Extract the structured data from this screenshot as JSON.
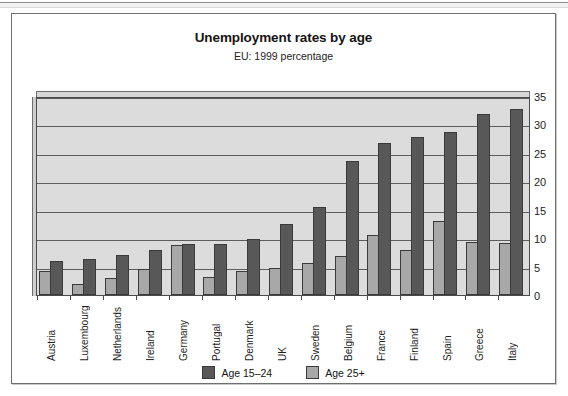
{
  "figure": {
    "title": "Unemployment rates by age",
    "subtitle": "EU: 1999 percentage"
  },
  "legend": {
    "items": [
      {
        "label": "Age 15–24",
        "color": "#585858",
        "swatch_name": "legend-swatch-age-15-24"
      },
      {
        "label": "Age 25+",
        "color": "#a8a8a8",
        "swatch_name": "legend-swatch-age-25-plus"
      }
    ]
  },
  "chart_data": {
    "type": "bar",
    "title": "Unemployment rates by age",
    "subtitle": "EU: 1999 percentage",
    "xlabel": "",
    "ylabel": "",
    "ylim": [
      0,
      35
    ],
    "yticks": [
      0,
      5,
      10,
      15,
      20,
      25,
      30,
      35
    ],
    "ytick_labels": [
      "0",
      "5",
      "10",
      "15",
      "20",
      "25",
      "30",
      "35"
    ],
    "grid": true,
    "grid_axis": "y",
    "legend_position": "bottom-center",
    "y_axis_side": "right",
    "categories": [
      "Austria",
      "Luxembourg",
      "Netherlands",
      "Ireland",
      "Germany",
      "Portugal",
      "Denmark",
      "UK",
      "Sweden",
      "Belgium",
      "France",
      "Finland",
      "Spain",
      "Greece",
      "Italy"
    ],
    "series": [
      {
        "name": "Age 15–24",
        "color": "#585858",
        "values": [
          6.0,
          6.3,
          7.0,
          8.0,
          9.0,
          9.0,
          9.8,
          12.5,
          15.5,
          23.5,
          26.7,
          27.8,
          28.7,
          31.8,
          32.8
        ]
      },
      {
        "name": "Age 25+",
        "color": "#a8a8a8",
        "values": [
          4.2,
          2.0,
          3.0,
          4.5,
          8.8,
          3.2,
          4.3,
          4.8,
          5.7,
          6.8,
          10.5,
          8.0,
          13.0,
          9.3,
          9.2
        ]
      }
    ]
  },
  "colors": {
    "dark_bar": "#585858",
    "light_bar": "#a8a8a8",
    "plot_background": "#dcdcdc",
    "frame": "#6f6f6f"
  }
}
